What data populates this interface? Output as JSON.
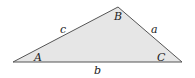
{
  "diagram": {
    "type": "triangle",
    "fill": "#e6e6e6",
    "stroke": "#555555",
    "vertices": {
      "A": {
        "label": "A",
        "x": 13,
        "y": 62
      },
      "B": {
        "label": "B",
        "x": 118,
        "y": 7
      },
      "C": {
        "label": "C",
        "x": 182,
        "y": 62
      }
    },
    "sides": {
      "a": {
        "label": "a"
      },
      "b": {
        "label": "b"
      },
      "c": {
        "label": "c"
      }
    }
  }
}
